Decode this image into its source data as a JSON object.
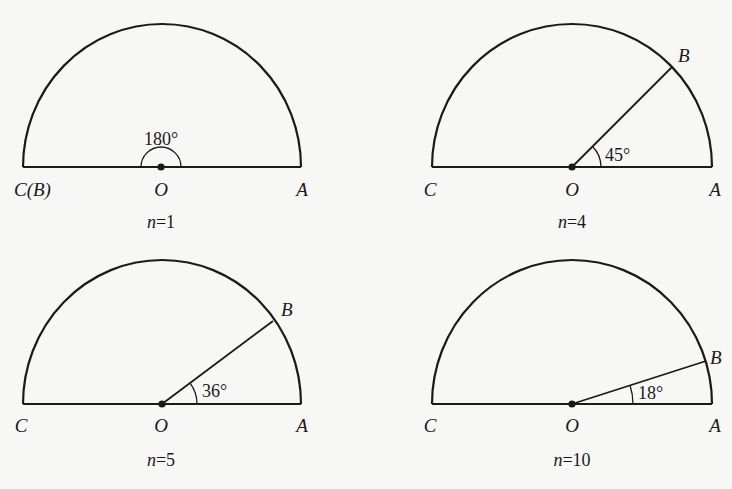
{
  "figure": {
    "colors": {
      "stroke": "#1a1a1a",
      "background": "#f7f7f5"
    },
    "panels": [
      {
        "id": "n1",
        "caption_var": "n",
        "caption_eq": "=1",
        "center_label": "O",
        "left_label": "C(B)",
        "right_label": "A",
        "b_label": "",
        "angle_label": "180°",
        "angle_deg": 180,
        "cx": 162,
        "cy": 167,
        "r": 139
      },
      {
        "id": "n4",
        "caption_var": "n",
        "caption_eq": "=4",
        "center_label": "O",
        "left_label": "C",
        "right_label": "A",
        "b_label": "B",
        "angle_label": "45°",
        "angle_deg": 45,
        "cx": 572,
        "cy": 167,
        "r": 140
      },
      {
        "id": "n5",
        "caption_var": "n",
        "caption_eq": "=5",
        "center_label": "O",
        "left_label": "C",
        "right_label": "A",
        "b_label": "B",
        "angle_label": "36°",
        "angle_deg": 36,
        "cx": 162,
        "cy": 404,
        "r": 139
      },
      {
        "id": "n10",
        "caption_var": "n",
        "caption_eq": "=10",
        "center_label": "O",
        "left_label": "C",
        "right_label": "A",
        "b_label": "B",
        "angle_label": "18°",
        "angle_deg": 18,
        "cx": 572,
        "cy": 404,
        "r": 140
      }
    ]
  }
}
